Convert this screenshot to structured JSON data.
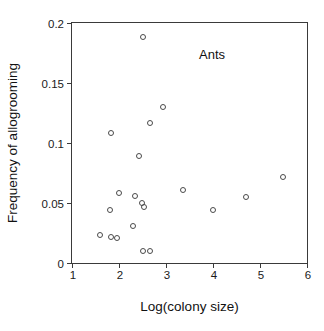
{
  "chart_data": {
    "type": "scatter",
    "title": "",
    "xlabel": "Log(colony size)",
    "ylabel": "Frequency of allogrooming",
    "xlim": [
      1,
      6
    ],
    "ylim": [
      0,
      0.2
    ],
    "xticks": [
      "1",
      "2",
      "3",
      "4",
      "5",
      "6"
    ],
    "xtick_values": [
      1,
      2,
      3,
      4,
      5,
      6
    ],
    "yticks": [
      "0",
      "0.05",
      "0.1",
      "0.15",
      "0.2"
    ],
    "ytick_values": [
      0,
      0.05,
      0.1,
      0.15,
      0.2
    ],
    "grid": false,
    "legend": false,
    "annotations": [
      {
        "text": "Ants",
        "x": 4.0,
        "y": 0.173
      }
    ],
    "marker": {
      "shape": "open-circle",
      "size_px": 6,
      "edge_color": "#4a4a4a",
      "fill": "none"
    },
    "series": [
      {
        "name": "Ants",
        "points": [
          {
            "x": 1.59,
            "y": 0.023
          },
          {
            "x": 1.8,
            "y": 0.044
          },
          {
            "x": 1.84,
            "y": 0.022
          },
          {
            "x": 1.84,
            "y": 0.108
          },
          {
            "x": 1.95,
            "y": 0.021
          },
          {
            "x": 2.0,
            "y": 0.058
          },
          {
            "x": 2.29,
            "y": 0.031
          },
          {
            "x": 2.34,
            "y": 0.056
          },
          {
            "x": 2.43,
            "y": 0.089
          },
          {
            "x": 2.48,
            "y": 0.05
          },
          {
            "x": 2.5,
            "y": 0.01
          },
          {
            "x": 2.52,
            "y": 0.188
          },
          {
            "x": 2.54,
            "y": 0.047
          },
          {
            "x": 2.67,
            "y": 0.01
          },
          {
            "x": 2.65,
            "y": 0.117
          },
          {
            "x": 2.94,
            "y": 0.13
          },
          {
            "x": 3.36,
            "y": 0.061
          },
          {
            "x": 4.0,
            "y": 0.044
          },
          {
            "x": 4.71,
            "y": 0.055
          },
          {
            "x": 5.49,
            "y": 0.072
          }
        ]
      }
    ]
  },
  "colors": {
    "axis": "#3a3a3a",
    "marker_edge": "#4a4a4a",
    "text": "#111111",
    "background": "#ffffff"
  }
}
